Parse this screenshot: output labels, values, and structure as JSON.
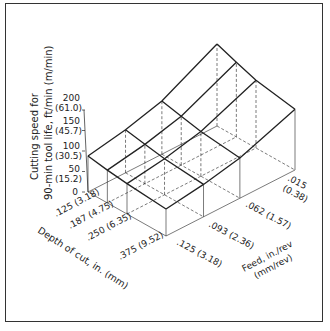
{
  "chart_data": {
    "type": "surface3d",
    "title": "",
    "zlabel": "Cutting speed for 90-min tool life, ft/min (m/min)",
    "zlabel_lines": [
      "Cutting speed for",
      "90-min tool life, ft/min (m/min)"
    ],
    "xlabel": "Depth of cut, in. (mm)",
    "ylabel_lines": [
      "Feed, in./rev",
      "(mm/rev)"
    ],
    "z_ticks": [
      {
        "value": 0,
        "label": "0",
        "sub": ""
      },
      {
        "value": 50,
        "label": "50",
        "sub": "(15.2)"
      },
      {
        "value": 100,
        "label": "100",
        "sub": "(30.5)"
      },
      {
        "value": 150,
        "label": "150",
        "sub": "(45.7)"
      },
      {
        "value": 200,
        "label": "200",
        "sub": "(61.0)"
      }
    ],
    "depth_ticks": [
      ".125 (3.18)",
      ".187 (4.75)",
      ".250 (6.35)",
      ".375 (9.52)"
    ],
    "feed_ticks": [
      ".125 (3.18)",
      ".093 (2.36)",
      ".062 (1.57)",
      ".015",
      "(0.38)"
    ],
    "depth_in": [
      0.125,
      0.187,
      0.25,
      0.375
    ],
    "feed_in": [
      0.125,
      0.093,
      0.062,
      0.015
    ],
    "zlim": [
      0,
      200
    ],
    "values_ft_min": [
      [
        88,
        80,
        74,
        66
      ],
      [
        105,
        96,
        88,
        79
      ],
      [
        130,
        119,
        109,
        98
      ],
      [
        200,
        182,
        165,
        148
      ]
    ],
    "values_note": "rows = feed (.125, .093, .062, .015); cols = depth (.125, .187, .250, .375); estimated from surface heights",
    "grid": true,
    "legend": "none"
  }
}
